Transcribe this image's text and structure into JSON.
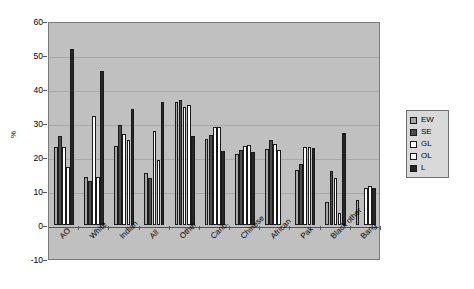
{
  "chart_data": {
    "type": "bar",
    "title": "",
    "xlabel": "",
    "ylabel": "%",
    "ylim": [
      -10,
      60
    ],
    "ytick_step": 10,
    "yticks": [
      -10,
      0,
      10,
      20,
      30,
      40,
      50,
      60
    ],
    "ytick_labels": [
      "-10",
      "0",
      "10",
      "20",
      "30",
      "40",
      "50",
      "60"
    ],
    "grid": true,
    "legend_position": "right",
    "categories": [
      "AO",
      "White",
      "Indian",
      "All",
      "Other",
      "Carib.",
      "Chinese",
      "African",
      "Pak",
      "Black other",
      "Bang"
    ],
    "series": [
      {
        "name": "EW",
        "color": "#a6a6a6",
        "values": [
          23.0,
          14.2,
          23.1,
          15.3,
          36.2,
          25.3,
          21.0,
          22.3,
          16.2,
          6.8,
          7.5
        ]
      },
      {
        "name": "SE",
        "color": "#4d4d4d",
        "values": [
          26.2,
          12.8,
          29.4,
          13.8,
          36.9,
          26.5,
          22.2,
          25.1,
          18.0,
          15.9,
          0.0
        ]
      },
      {
        "name": "GL",
        "color": "#ffffff",
        "values": [
          23.0,
          32.2,
          26.7,
          27.6,
          34.8,
          28.8,
          23.3,
          23.9,
          23.0,
          13.8,
          11.0
        ]
      },
      {
        "name": "OL",
        "color": "#fbfbfb",
        "values": [
          17.2,
          14.0,
          25.0,
          19.2,
          35.4,
          28.7,
          23.4,
          22.2,
          23.0,
          3.5,
          11.5
        ]
      },
      {
        "name": "L",
        "color": "#262626",
        "values": [
          51.7,
          45.2,
          34.1,
          36.3,
          26.2,
          21.8,
          21.5,
          0.0,
          22.6,
          27.0,
          11.0
        ]
      }
    ]
  },
  "legend": {
    "items": [
      {
        "label": "EW"
      },
      {
        "label": "SE"
      },
      {
        "label": "GL"
      },
      {
        "label": "OL"
      },
      {
        "label": "L"
      }
    ]
  },
  "axis": {
    "y_title": "%"
  }
}
